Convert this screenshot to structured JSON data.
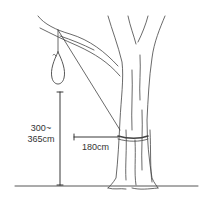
{
  "diagram": {
    "type": "illustration",
    "labels": {
      "height_line1": "300~",
      "height_line2": "365cm",
      "distance": "180cm"
    },
    "colors": {
      "ink": "#333333",
      "background": "#ffffff"
    }
  }
}
